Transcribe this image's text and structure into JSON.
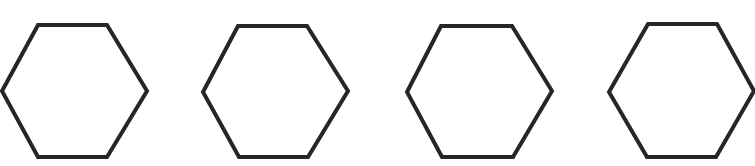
{
  "figure": {
    "canvas": {
      "width": 755,
      "height": 166,
      "background_color": "#ffffff"
    },
    "style": {
      "stroke_color": "#262626",
      "stroke_width": 4,
      "fill_color": "none"
    },
    "shape_count": 4,
    "shape_type": "hexagon",
    "orientation": "flat-top",
    "shapes": [
      {
        "name": "hexagon-1",
        "index": 1,
        "center_x": 74.5,
        "center_y": 91,
        "width": 145,
        "height": 132,
        "points": "2,91 38,25 107,25 147,91 107,157 38,157"
      },
      {
        "name": "hexagon-2",
        "index": 2,
        "center_x": 275.5,
        "center_y": 91,
        "width": 145,
        "height": 132,
        "points": "203,92 238,26 307,26 348,91 308,157 239,157"
      },
      {
        "name": "hexagon-3",
        "index": 3,
        "center_x": 479.5,
        "center_y": 91,
        "width": 145,
        "height": 132,
        "points": "407,92 441,26 512,26 552,91 513,157 442,157"
      },
      {
        "name": "hexagon-4",
        "index": 4,
        "center_x": 679.5,
        "center_y": 91,
        "width": 141,
        "height": 132,
        "points": "609,92 648,24 717,24 754,91 716,157 647,157"
      }
    ]
  }
}
